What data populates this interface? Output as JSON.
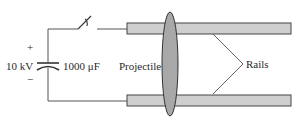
{
  "diagram": {
    "type": "railgun-circuit",
    "labels": {
      "plus": "+",
      "minus": "−",
      "voltage": "10 kV",
      "capacitance": "1000 μF",
      "projectile": "Projectile",
      "rails": "Rails"
    },
    "colors": {
      "wire": "#555555",
      "rail_fill": "#cfcfcf",
      "rail_stroke": "#444444",
      "projectile_fill": "#a8a8a8",
      "projectile_stroke": "#333333",
      "text": "#2a2a2a"
    },
    "components": [
      "capacitor",
      "switch",
      "upper-rail",
      "lower-rail",
      "projectile"
    ]
  }
}
